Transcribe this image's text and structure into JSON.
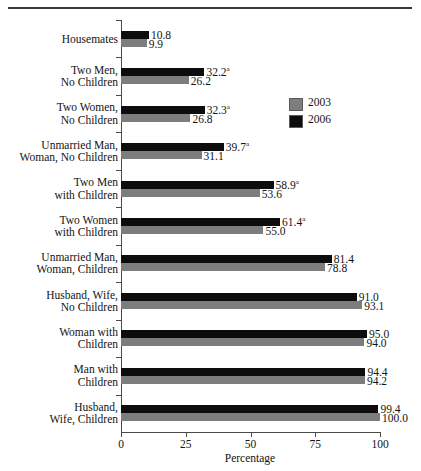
{
  "chart_data": {
    "type": "bar",
    "orientation": "horizontal",
    "title": "",
    "xlabel": "Percentage",
    "ylabel": "",
    "xlim": [
      0,
      100
    ],
    "xticks": [
      0,
      25,
      50,
      75,
      100
    ],
    "xticklabels": [
      "0",
      "25",
      "50",
      "75",
      "100"
    ],
    "grid": false,
    "legend_position": "right-upper",
    "legend": [
      "2003",
      "2006"
    ],
    "footnote_marker": "a",
    "categories": [
      "Housemates",
      "Two Men,\nNo Children",
      "Two Women,\nNo Children",
      "Unmarried Man,\nWoman, No Children",
      "Two Men\nwith Children",
      "Two Women\nwith Children",
      "Unmarried Man,\nWoman, Children",
      "Husband, Wife,\nNo Children",
      "Woman with\nChildren",
      "Man with\nChildren",
      "Husband,\nWife, Children"
    ],
    "series": [
      {
        "name": "2006",
        "color": "#0d0d0d",
        "values": [
          10.8,
          32.2,
          32.3,
          39.7,
          58.9,
          61.4,
          81.4,
          91.0,
          95.0,
          94.4,
          99.4
        ],
        "labels": [
          "10.8",
          "32.2",
          "32.3",
          "39.7",
          "58.9",
          "61.4",
          "81.4",
          "91.0",
          "95.0",
          "94.4",
          "99.4"
        ],
        "marks": [
          "",
          "a",
          "a",
          "a",
          "a",
          "a",
          "",
          "",
          "",
          "",
          ""
        ]
      },
      {
        "name": "2003",
        "color": "#7d7d7d",
        "values": [
          9.9,
          26.2,
          26.8,
          31.1,
          53.6,
          55.0,
          78.8,
          93.1,
          94.0,
          94.2,
          100.0
        ],
        "labels": [
          "9.9",
          "26.2",
          "26.8",
          "31.1",
          "53.6",
          "55.0",
          "78.8",
          "93.1",
          "94.0",
          "94.2",
          "100.0"
        ],
        "marks": [
          "",
          "",
          "",
          "",
          "",
          "",
          "",
          "",
          "",
          "",
          ""
        ]
      }
    ]
  },
  "legend": {
    "items": [
      {
        "label": "2003",
        "color": "#7d7d7d"
      },
      {
        "label": "2006",
        "color": "#0d0d0d"
      }
    ]
  },
  "axis": {
    "x_title": "Percentage"
  }
}
